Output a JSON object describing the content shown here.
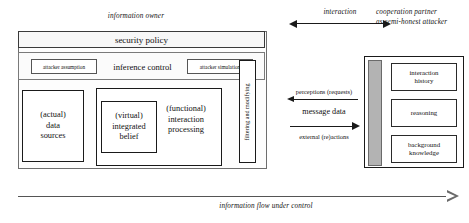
{
  "diagram": {
    "top_labels": {
      "information_owner": "information owner",
      "interaction": "interaction",
      "cooperation_partner_line1": "cooperation partner",
      "cooperation_partner_line2": "as semi-honest attacker"
    },
    "owner": {
      "security_policy": "security policy",
      "inference_control": "inference control",
      "attacker_assumption": "attacker assumption",
      "attacker_simulation": "attacker simulation",
      "data_sources_line1": "(actual)",
      "data_sources_line2": "data",
      "data_sources_line3": "sources",
      "integrated_belief_line1": "(virtual)",
      "integrated_belief_line2": "integrated",
      "integrated_belief_line3": "belief",
      "interaction_processing_line1": "(functional)",
      "interaction_processing_line2": "interaction",
      "interaction_processing_line3": "processing",
      "filtering_and_modifying": "filtering and modifying"
    },
    "messages": {
      "perceptions": "perceptions (requests)",
      "message_data": "message data",
      "external_reactions": "external (re)actions"
    },
    "partner": {
      "interaction_history_line1": "interaction",
      "interaction_history_line2": "history",
      "reasoning": "reasoning",
      "background_knowledge_line1": "background",
      "background_knowledge_line2": "knowledge"
    },
    "bottom": {
      "information_flow": "information flow under control"
    },
    "colors": {
      "gray_bar": "#b3b3b3",
      "flow_arrow": "#555555",
      "box_border": "#1a1a1a"
    }
  }
}
